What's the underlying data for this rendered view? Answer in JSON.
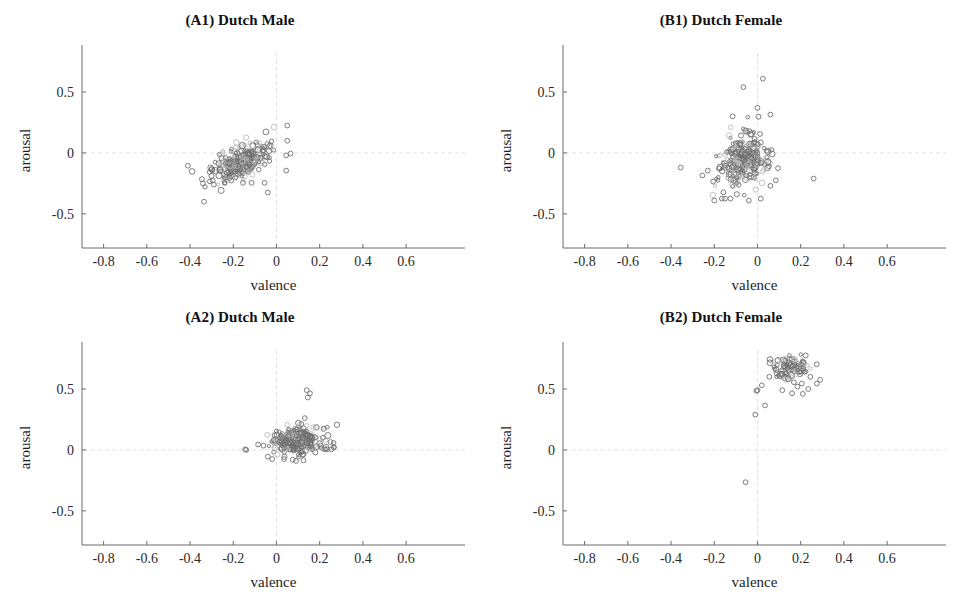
{
  "figure": {
    "width": 961,
    "height": 595,
    "background": "#ffffff",
    "marker_color": "#8d8d8d",
    "axis_color": "#6b6b6b",
    "reference_line_color": "#e2e2e2"
  },
  "axes_common": {
    "xlabel": "valence",
    "ylabel": "arousal",
    "xticks": [
      "-0.8",
      "-0.6",
      "-0.4",
      "-0.2",
      "0",
      "0.2",
      "0.4",
      "0.6"
    ],
    "xtick_values": [
      -0.8,
      -0.6,
      -0.4,
      -0.2,
      0,
      0.2,
      0.4,
      0.6
    ],
    "yticks": [
      "0.5",
      "0",
      "-0.5"
    ],
    "ytick_values": [
      0.5,
      0,
      -0.5
    ],
    "xlim": [
      -0.9,
      0.78
    ],
    "ylim": [
      -0.78,
      0.82
    ],
    "grid": false,
    "reference_lines": {
      "x": 0,
      "y": 0
    }
  },
  "chart_data": [
    {
      "id": "A1",
      "type": "scatter",
      "title": "(A1) Dutch Male",
      "xlabel": "valence",
      "ylabel": "arousal",
      "xlim": [
        -0.9,
        0.78
      ],
      "ylim": [
        -0.78,
        0.82
      ],
      "xticks": [
        -0.8,
        -0.6,
        -0.4,
        -0.2,
        0,
        0.2,
        0.4,
        0.6
      ],
      "yticks": [
        0.5,
        0,
        -0.5
      ],
      "grid": false,
      "n_points": 260,
      "cluster": {
        "mean_x": -0.165,
        "mean_y": -0.075,
        "sd_x": 0.065,
        "sd_y": 0.075,
        "correlation": 0.62
      },
      "seed": 11,
      "outliers": [
        [
          -0.41,
          -0.105
        ],
        [
          -0.345,
          -0.215
        ],
        [
          -0.34,
          -0.25
        ],
        [
          -0.335,
          -0.4
        ],
        [
          -0.295,
          -0.225
        ],
        [
          -0.29,
          -0.26
        ],
        [
          -0.24,
          -0.245
        ],
        [
          -0.155,
          -0.245
        ],
        [
          -0.115,
          -0.245
        ],
        [
          -0.055,
          -0.245
        ],
        [
          -0.04,
          -0.325
        ],
        [
          0.045,
          -0.145
        ],
        [
          0.05,
          0.225
        ],
        [
          0.05,
          0.1
        ],
        [
          0.045,
          -0.02
        ],
        [
          0.065,
          -0.005
        ]
      ]
    },
    {
      "id": "B1",
      "type": "scatter",
      "title": "(B1) Dutch Female",
      "xlabel": "valence",
      "ylabel": "arousal",
      "xlim": [
        -0.9,
        0.78
      ],
      "ylim": [
        -0.78,
        0.82
      ],
      "xticks": [
        -0.8,
        -0.6,
        -0.4,
        -0.2,
        0,
        0.2,
        0.4,
        0.6
      ],
      "yticks": [
        0.5,
        0,
        -0.5
      ],
      "grid": false,
      "n_points": 250,
      "cluster": {
        "mean_x": -0.065,
        "mean_y": -0.065,
        "sd_x": 0.055,
        "sd_y": 0.105,
        "correlation": 0.18
      },
      "seed": 23,
      "outliers": [
        [
          -0.355,
          -0.12
        ],
        [
          -0.255,
          -0.185
        ],
        [
          -0.23,
          -0.145
        ],
        [
          -0.205,
          -0.235
        ],
        [
          -0.2,
          -0.39
        ],
        [
          -0.165,
          -0.375
        ],
        [
          -0.15,
          -0.375
        ],
        [
          -0.125,
          -0.375
        ],
        [
          -0.04,
          -0.39
        ],
        [
          0.015,
          -0.375
        ],
        [
          0.06,
          -0.27
        ],
        [
          0.085,
          -0.225
        ],
        [
          0.26,
          -0.21
        ],
        [
          0.025,
          0.61
        ],
        [
          -0.065,
          0.54
        ],
        [
          0.0,
          0.37
        ],
        [
          0.06,
          0.315
        ],
        [
          -0.115,
          0.3
        ],
        [
          0.095,
          -0.125
        ]
      ]
    },
    {
      "id": "A2",
      "type": "scatter",
      "title": "(A2) Dutch Male",
      "xlabel": "valence",
      "ylabel": "arousal",
      "xlim": [
        -0.9,
        0.78
      ],
      "ylim": [
        -0.78,
        0.82
      ],
      "xticks": [
        -0.8,
        -0.6,
        -0.4,
        -0.2,
        0,
        0.2,
        0.4,
        0.6
      ],
      "yticks": [
        0.5,
        0,
        -0.5
      ],
      "grid": false,
      "n_points": 245,
      "cluster": {
        "mean_x": 0.1,
        "mean_y": 0.085,
        "sd_x": 0.058,
        "sd_y": 0.06,
        "correlation": 0.05
      },
      "seed": 37,
      "outliers": [
        [
          -0.145,
          0.005
        ],
        [
          -0.14,
          0.0
        ],
        [
          -0.085,
          0.045
        ],
        [
          -0.06,
          0.035
        ],
        [
          -0.04,
          -0.055
        ],
        [
          -0.02,
          -0.075
        ],
        [
          0.035,
          -0.075
        ],
        [
          0.075,
          -0.08
        ],
        [
          0.09,
          -0.09
        ],
        [
          0.125,
          -0.085
        ],
        [
          0.145,
          0.43
        ],
        [
          0.14,
          0.49
        ],
        [
          0.155,
          0.465
        ],
        [
          0.225,
          0.005
        ],
        [
          0.235,
          0.005
        ],
        [
          0.25,
          0.065
        ],
        [
          0.255,
          0.005
        ],
        [
          0.215,
          0.1
        ],
        [
          0.265,
          0.02
        ]
      ]
    },
    {
      "id": "B2",
      "type": "scatter",
      "title": "(B2) Dutch Female",
      "xlabel": "valence",
      "ylabel": "arousal",
      "xlim": [
        -0.9,
        0.78
      ],
      "ylim": [
        -0.78,
        0.82
      ],
      "xticks": [
        -0.8,
        -0.6,
        -0.4,
        -0.2,
        0,
        0.2,
        0.4,
        0.6
      ],
      "yticks": [
        0.5,
        0,
        -0.5
      ],
      "grid": false,
      "n_points": 95,
      "cluster": {
        "mean_x": 0.155,
        "mean_y": 0.675,
        "sd_x": 0.045,
        "sd_y": 0.045,
        "correlation": 0.1
      },
      "seed": 53,
      "outliers": [
        [
          -0.055,
          -0.265
        ],
        [
          -0.01,
          0.29
        ],
        [
          0.035,
          0.365
        ],
        [
          0.0,
          0.49
        ],
        [
          -0.005,
          0.485
        ],
        [
          0.02,
          0.53
        ],
        [
          0.115,
          0.49
        ],
        [
          0.16,
          0.465
        ],
        [
          0.185,
          0.52
        ],
        [
          0.21,
          0.46
        ],
        [
          0.205,
          0.545
        ],
        [
          0.275,
          0.545
        ],
        [
          0.235,
          0.5
        ],
        [
          0.29,
          0.575
        ],
        [
          0.245,
          0.6
        ],
        [
          0.055,
          0.6
        ]
      ]
    }
  ]
}
